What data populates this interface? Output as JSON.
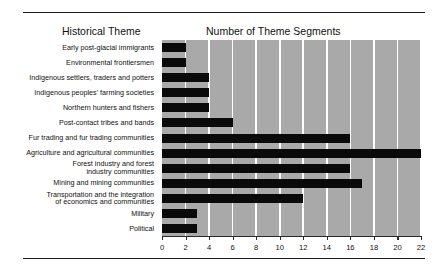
{
  "headers": {
    "left": "Historical Theme",
    "right": "Number of Theme Segments"
  },
  "chart_data": {
    "type": "bar",
    "orientation": "horizontal",
    "title": "Number of Theme Segments",
    "xlabel": "Number of Theme Segments",
    "ylabel": "Historical Theme",
    "xlim": [
      0,
      22
    ],
    "xticks": [
      0,
      2,
      4,
      6,
      8,
      10,
      12,
      14,
      16,
      18,
      20,
      22
    ],
    "grid": true,
    "grid_axis": "x",
    "grid_color": "#ffffff",
    "plot_background": "#a9a9a9",
    "bar_color": "#0a0a0a",
    "legend": null,
    "categories": [
      "Early post-glacial immigrants",
      "Environmental frontiersmen",
      "Indigenous settlers, traders and potters",
      "Indigenous peoples' farming societies",
      "Northern hunters and fishers",
      "Post-contact tribes and bands",
      "Fur trading and fur trading communities",
      "Agriculture and agricultural communities",
      "Forest industry and forest\nindustry communities",
      "Mining and mining communities",
      "Transportation and the integration\nof economics and communities",
      "Military",
      "Political"
    ],
    "values": [
      2,
      2,
      4,
      4,
      4,
      6,
      16,
      22,
      16,
      17,
      12,
      3,
      3
    ]
  }
}
